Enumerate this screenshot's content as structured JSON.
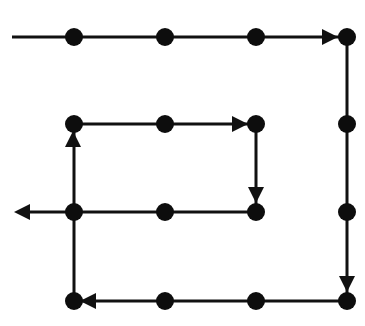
{
  "diagram": {
    "colors": {
      "stroke": "#111111",
      "node": "#0d0d0d",
      "background": "#ffffff"
    },
    "stroke_width": 3,
    "node_radius": 9,
    "grid": {
      "columns_x": [
        74,
        165,
        256,
        347
      ],
      "rows_y": [
        37,
        124,
        212,
        301
      ]
    },
    "start_point": [
      12,
      37
    ],
    "end_point": [
      14,
      212
    ],
    "nodes": [
      {
        "id": "n1",
        "x": 74,
        "y": 37
      },
      {
        "id": "n2",
        "x": 165,
        "y": 37
      },
      {
        "id": "n3",
        "x": 256,
        "y": 37
      },
      {
        "id": "n4",
        "x": 347,
        "y": 37
      },
      {
        "id": "n5",
        "x": 347,
        "y": 124
      },
      {
        "id": "n6",
        "x": 347,
        "y": 212
      },
      {
        "id": "n7",
        "x": 347,
        "y": 301
      },
      {
        "id": "n8",
        "x": 256,
        "y": 301
      },
      {
        "id": "n9",
        "x": 165,
        "y": 301
      },
      {
        "id": "n10",
        "x": 74,
        "y": 301
      },
      {
        "id": "n11",
        "x": 74,
        "y": 212
      },
      {
        "id": "n12",
        "x": 74,
        "y": 124
      },
      {
        "id": "n13",
        "x": 165,
        "y": 124
      },
      {
        "id": "n14",
        "x": 256,
        "y": 124
      },
      {
        "id": "n15",
        "x": 256,
        "y": 212
      },
      {
        "id": "n16",
        "x": 165,
        "y": 212
      }
    ],
    "path": [
      [
        12,
        37
      ],
      [
        347,
        37
      ],
      [
        347,
        301
      ],
      [
        74,
        301
      ],
      [
        74,
        124
      ],
      [
        256,
        124
      ],
      [
        256,
        212
      ],
      [
        74,
        212
      ],
      [
        22,
        212
      ]
    ],
    "arrows": [
      {
        "name": "arrow-right-top",
        "tip": [
          338,
          37
        ],
        "direction": "right"
      },
      {
        "name": "arrow-down-right",
        "tip": [
          347,
          292
        ],
        "direction": "down"
      },
      {
        "name": "arrow-left-bottom",
        "tip": [
          80,
          301
        ],
        "direction": "left"
      },
      {
        "name": "arrow-up-left",
        "tip": [
          73,
          131
        ],
        "direction": "up"
      },
      {
        "name": "arrow-right-inner",
        "tip": [
          248,
          124
        ],
        "direction": "right"
      },
      {
        "name": "arrow-down-inner",
        "tip": [
          256,
          203
        ],
        "direction": "down"
      },
      {
        "name": "arrow-left-exit",
        "tip": [
          14,
          212
        ],
        "direction": "left"
      }
    ]
  }
}
